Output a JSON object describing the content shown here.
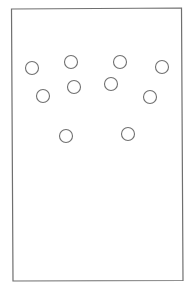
{
  "diagram": {
    "type": "dot-pattern",
    "frame": {
      "stroke": "#6f6f6f",
      "points": [
        [
          11.5,
          9
        ],
        [
          181.5,
          8
        ],
        [
          183,
          280.5
        ],
        [
          13,
          281
        ]
      ]
    },
    "circle_style": {
      "radius": 6.5,
      "stroke": "#707070",
      "fill": "#ffffff"
    },
    "circles": [
      {
        "id": 1,
        "cx": 32,
        "cy": 68
      },
      {
        "id": 2,
        "cx": 71,
        "cy": 62
      },
      {
        "id": 3,
        "cx": 120,
        "cy": 62
      },
      {
        "id": 4,
        "cx": 162,
        "cy": 67
      },
      {
        "id": 5,
        "cx": 43,
        "cy": 96
      },
      {
        "id": 6,
        "cx": 74,
        "cy": 87
      },
      {
        "id": 7,
        "cx": 111,
        "cy": 84
      },
      {
        "id": 8,
        "cx": 150,
        "cy": 97
      },
      {
        "id": 9,
        "cx": 66,
        "cy": 136
      },
      {
        "id": 10,
        "cx": 128,
        "cy": 134
      }
    ],
    "circle_count": 10
  }
}
